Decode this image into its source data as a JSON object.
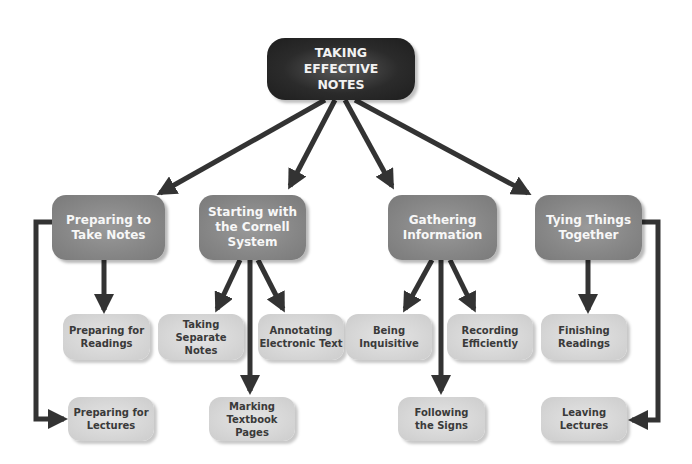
{
  "diagram": {
    "root": {
      "label": "TAKING\nEFFECTIVE\nNOTES"
    },
    "branches": [
      {
        "label": "Preparing to\nTake Notes",
        "children": [
          {
            "label": "Preparing for\nReadings"
          },
          {
            "label": "Preparing for\nLectures"
          }
        ]
      },
      {
        "label": "Starting with\nthe Cornell\nSystem",
        "children": [
          {
            "label": "Taking\nSeparate Notes"
          },
          {
            "label": "Annotating\nElectronic Text"
          },
          {
            "label": "Marking\nTextbook Pages"
          }
        ]
      },
      {
        "label": "Gathering\nInformation",
        "children": [
          {
            "label": "Being\nInquisitive"
          },
          {
            "label": "Recording\nEfficiently"
          },
          {
            "label": "Following\nthe Signs"
          }
        ]
      },
      {
        "label": "Tying Things\nTogether",
        "children": [
          {
            "label": "Finishing\nReadings"
          },
          {
            "label": "Leaving\nLectures"
          }
        ]
      }
    ],
    "colors": {
      "root_fill": "#2b2b2b",
      "branch_fill": "#868686",
      "leaf_fill": "#d6d6d6",
      "arrow": "#333333"
    }
  }
}
